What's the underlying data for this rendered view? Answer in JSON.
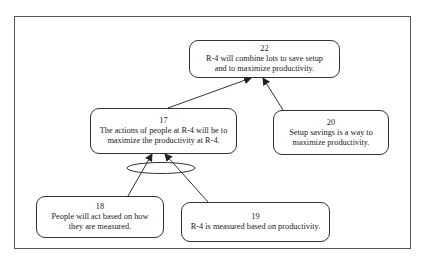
{
  "diagram": {
    "type": "logic-tree",
    "nodes": [
      {
        "id": "22",
        "number": "22",
        "text": "R-4 will combine lots to save setup  and to maximize productivity."
      },
      {
        "id": "17",
        "number": "17",
        "text": "The actions of people  at R-4 will be to maximize the productivity at R-4."
      },
      {
        "id": "20",
        "number": "20",
        "text": "Setup savings is a way to maximize productivity."
      },
      {
        "id": "18",
        "number": "18",
        "text": "People will act based on how they are measured."
      },
      {
        "id": "19",
        "number": "19",
        "text": "R-4 is measured  based on productivity."
      }
    ],
    "edges": [
      {
        "from": "17",
        "to": "22"
      },
      {
        "from": "20",
        "to": "22"
      },
      {
        "from": "18",
        "to": "17",
        "and_group": "A"
      },
      {
        "from": "19",
        "to": "17",
        "and_group": "A"
      }
    ],
    "colors": {
      "line": "#333333",
      "frame": "#555555",
      "background": "#ffffff"
    }
  }
}
